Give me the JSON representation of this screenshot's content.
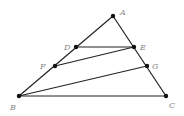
{
  "diagram": {
    "type": "geometry",
    "points": {
      "A": {
        "label": "A",
        "x": 113,
        "y": 16,
        "lx": 120,
        "ly": 15
      },
      "D": {
        "label": "D",
        "x": 76,
        "y": 47,
        "lx": 64,
        "ly": 50
      },
      "E": {
        "label": "E",
        "x": 134,
        "y": 47,
        "lx": 140,
        "ly": 50
      },
      "F": {
        "label": "F",
        "x": 55,
        "y": 66,
        "lx": 40,
        "ly": 69
      },
      "G": {
        "label": "G",
        "x": 147,
        "y": 66,
        "lx": 152,
        "ly": 69
      },
      "B": {
        "label": "B",
        "x": 19,
        "y": 96,
        "lx": 10,
        "ly": 110
      },
      "C": {
        "label": "C",
        "x": 166,
        "y": 96,
        "lx": 169,
        "ly": 108
      }
    },
    "segments": [
      [
        "A",
        "B"
      ],
      [
        "A",
        "C"
      ],
      [
        "B",
        "C"
      ],
      [
        "D",
        "E"
      ],
      [
        "F",
        "E"
      ],
      [
        "B",
        "G"
      ]
    ]
  }
}
